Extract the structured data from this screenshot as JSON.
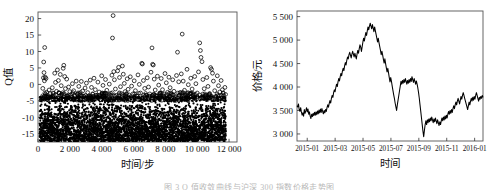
{
  "figure": {
    "caption": "图 3  Q 值收敛曲线与沪深 300 指数价格走势图",
    "background": "#ffffff",
    "ink": "#111111"
  },
  "chart_data": [
    {
      "type": "scatter",
      "id": "q-value-convergence",
      "title": "",
      "xlabel": "时间/步",
      "ylabel": "Q值",
      "xlim": [
        0,
        12500
      ],
      "ylim": [
        -17.5,
        22
      ],
      "xticks": [
        0,
        2000,
        4000,
        6000,
        8000,
        10000,
        12000
      ],
      "xtick_labels": [
        "0",
        "2 000",
        "4 000",
        "6 000",
        "8 000",
        "10 000",
        "12 000"
      ],
      "yticks": [
        20,
        15,
        10,
        5,
        0,
        -5,
        -10,
        -15
      ],
      "ytick_labels": [
        "20",
        "15",
        "10",
        "5",
        "0",
        "-5",
        "-10",
        "-15"
      ],
      "grid": false,
      "legend": null,
      "marker": "open-circle",
      "marker_color": "#000000",
      "description": "密集散点带集中于 -17 至 -5 区间，少量离群点分布至 +21",
      "dense_band": {
        "x_start": 100,
        "x_end": 11800,
        "y_low": -17.3,
        "y_high": -5.2,
        "n": 4200
      },
      "upper_points": [
        [
          300,
          -1.2
        ],
        [
          340,
          2.0
        ],
        [
          360,
          6.8
        ],
        [
          380,
          3.6
        ],
        [
          400,
          1.1
        ],
        [
          420,
          11.2
        ],
        [
          455,
          2.2
        ],
        [
          470,
          -3.0
        ],
        [
          500,
          1.8
        ],
        [
          540,
          -2.4
        ],
        [
          600,
          -4.0
        ],
        [
          640,
          -3.4
        ],
        [
          700,
          -1.7
        ],
        [
          760,
          -2.8
        ],
        [
          820,
          -3.9
        ],
        [
          900,
          -1.0
        ],
        [
          980,
          -3.3
        ],
        [
          1050,
          3.4
        ],
        [
          1100,
          0.6
        ],
        [
          1160,
          -2.1
        ],
        [
          1220,
          4.4
        ],
        [
          1280,
          1.2
        ],
        [
          1340,
          -2.6
        ],
        [
          1400,
          3.0
        ],
        [
          1460,
          -0.4
        ],
        [
          1520,
          -3.1
        ],
        [
          1580,
          4.9
        ],
        [
          1620,
          5.8
        ],
        [
          1680,
          2.4
        ],
        [
          1720,
          -1.3
        ],
        [
          1800,
          1.6
        ],
        [
          1860,
          -3.6
        ],
        [
          1920,
          -0.8
        ],
        [
          2000,
          -2.2
        ],
        [
          2080,
          -3.8
        ],
        [
          2160,
          0.2
        ],
        [
          2240,
          -1.9
        ],
        [
          2320,
          -3.5
        ],
        [
          2400,
          1.0
        ],
        [
          2480,
          -2.9
        ],
        [
          2560,
          -0.6
        ],
        [
          2640,
          -3.2
        ],
        [
          2720,
          0.9
        ],
        [
          2800,
          -2.0
        ],
        [
          2880,
          -3.7
        ],
        [
          2960,
          -1.1
        ],
        [
          3040,
          0.4
        ],
        [
          3120,
          -2.5
        ],
        [
          3200,
          -3.9
        ],
        [
          3280,
          1.3
        ],
        [
          3360,
          -0.9
        ],
        [
          3440,
          -3.0
        ],
        [
          3520,
          1.9
        ],
        [
          3600,
          -1.6
        ],
        [
          3680,
          -3.4
        ],
        [
          3760,
          0.7
        ],
        [
          3840,
          -2.3
        ],
        [
          3920,
          -3.6
        ],
        [
          4000,
          2.6
        ],
        [
          4080,
          -0.3
        ],
        [
          4160,
          -3.1
        ],
        [
          4240,
          1.5
        ],
        [
          4320,
          -1.8
        ],
        [
          4400,
          -3.8
        ],
        [
          4480,
          0.1
        ],
        [
          4560,
          -2.7
        ],
        [
          4640,
          2.8
        ],
        [
          4680,
          14.1
        ],
        [
          4720,
          20.9
        ],
        [
          4760,
          3.9
        ],
        [
          4800,
          1.4
        ],
        [
          4860,
          -1.4
        ],
        [
          4920,
          -3.3
        ],
        [
          5000,
          4.1
        ],
        [
          5060,
          5.2
        ],
        [
          5120,
          2.1
        ],
        [
          5180,
          -0.7
        ],
        [
          5240,
          -2.8
        ],
        [
          5300,
          5.6
        ],
        [
          5360,
          3.1
        ],
        [
          5420,
          0.3
        ],
        [
          5480,
          -2.2
        ],
        [
          5540,
          -3.7
        ],
        [
          5600,
          1.7
        ],
        [
          5660,
          -1.5
        ],
        [
          5720,
          -3.2
        ],
        [
          5800,
          2.3
        ],
        [
          5880,
          -0.5
        ],
        [
          5960,
          -2.9
        ],
        [
          6040,
          1.1
        ],
        [
          6120,
          -1.9
        ],
        [
          6200,
          -3.5
        ],
        [
          6280,
          2.9
        ],
        [
          6360,
          0.0
        ],
        [
          6440,
          -2.6
        ],
        [
          6520,
          6.4
        ],
        [
          6560,
          6.2
        ],
        [
          6620,
          1.2
        ],
        [
          6700,
          -1.2
        ],
        [
          6780,
          -3.3
        ],
        [
          6860,
          2.0
        ],
        [
          6940,
          -0.8
        ],
        [
          7020,
          -2.9
        ],
        [
          7100,
          3.7
        ],
        [
          7160,
          11.1
        ],
        [
          7200,
          6.1
        ],
        [
          7240,
          5.9
        ],
        [
          7300,
          1.6
        ],
        [
          7360,
          -1.7
        ],
        [
          7420,
          -3.4
        ],
        [
          7500,
          2.5
        ],
        [
          7580,
          -0.2
        ],
        [
          7660,
          -2.7
        ],
        [
          7740,
          1.8
        ],
        [
          7820,
          -1.6
        ],
        [
          7900,
          -3.6
        ],
        [
          7980,
          3.3
        ],
        [
          8060,
          0.5
        ],
        [
          8140,
          -2.4
        ],
        [
          8220,
          2.2
        ],
        [
          8300,
          -1.0
        ],
        [
          8380,
          -3.1
        ],
        [
          8460,
          1.4
        ],
        [
          8540,
          -2.1
        ],
        [
          8620,
          -3.8
        ],
        [
          8700,
          2.7
        ],
        [
          8760,
          9.8
        ],
        [
          8840,
          0.8
        ],
        [
          8920,
          -2.5
        ],
        [
          9000,
          3.2
        ],
        [
          9060,
          15.3
        ],
        [
          9120,
          1.0
        ],
        [
          9200,
          -1.8
        ],
        [
          9280,
          -3.5
        ],
        [
          9360,
          4.6
        ],
        [
          9440,
          -0.1
        ],
        [
          9520,
          -2.8
        ],
        [
          9600,
          1.9
        ],
        [
          9680,
          -1.4
        ],
        [
          9760,
          -3.2
        ],
        [
          9840,
          2.4
        ],
        [
          9920,
          0.2
        ],
        [
          10000,
          -2.6
        ],
        [
          10080,
          3.8
        ],
        [
          10160,
          12.6
        ],
        [
          10200,
          10.3
        ],
        [
          10240,
          8.2
        ],
        [
          10300,
          6.9
        ],
        [
          10360,
          1.5
        ],
        [
          10440,
          -1.3
        ],
        [
          10520,
          -3.4
        ],
        [
          10600,
          2.1
        ],
        [
          10680,
          -0.6
        ],
        [
          10760,
          -2.9
        ],
        [
          10840,
          5.1
        ],
        [
          10900,
          4.6
        ],
        [
          10960,
          3.4
        ],
        [
          11020,
          1.0
        ],
        [
          11100,
          -1.9
        ],
        [
          11180,
          -3.6
        ],
        [
          11260,
          2.6
        ],
        [
          11340,
          -0.4
        ],
        [
          11420,
          -2.3
        ],
        [
          11500,
          1.2
        ],
        [
          11580,
          -1.6
        ],
        [
          11660,
          -3.3
        ],
        [
          11740,
          -0.9
        ]
      ]
    },
    {
      "type": "line",
      "id": "price-series",
      "title": "",
      "xlabel": "时间",
      "ylabel": "价格/元",
      "xlim": [
        0,
        1
      ],
      "ylim": [
        2850,
        5620
      ],
      "xticks": [
        0.055,
        0.205,
        0.355,
        0.505,
        0.655,
        0.805,
        0.955
      ],
      "xtick_labels": [
        "2015-01",
        "2015-03",
        "2015-05",
        "2015-07",
        "2015-09",
        "2015-11",
        "2016-01"
      ],
      "yticks": [
        5500,
        5000,
        4500,
        4000,
        3500,
        3000
      ],
      "ytick_labels": [
        "5 500",
        "5 000",
        "4 500",
        "4 000",
        "3 500",
        "3 000"
      ],
      "grid": false,
      "legend": null,
      "line_color": "#000000",
      "values": [
        3600,
        3575,
        3640,
        3520,
        3480,
        3560,
        3470,
        3400,
        3450,
        3380,
        3520,
        3440,
        3490,
        3560,
        3470,
        3530,
        3420,
        3470,
        3380,
        3330,
        3420,
        3370,
        3440,
        3390,
        3460,
        3400,
        3470,
        3410,
        3490,
        3430,
        3510,
        3450,
        3530,
        3460,
        3540,
        3480,
        3430,
        3500,
        3450,
        3520,
        3480,
        3560,
        3620,
        3570,
        3650,
        3710,
        3660,
        3760,
        3820,
        3780,
        3880,
        3940,
        3900,
        3990,
        4060,
        4010,
        4110,
        4180,
        4130,
        4220,
        4290,
        4240,
        4340,
        4400,
        4350,
        4450,
        4520,
        4470,
        4570,
        4640,
        4600,
        4690,
        4740,
        4680,
        4620,
        4700,
        4760,
        4700,
        4640,
        4720,
        4660,
        4600,
        4700,
        4780,
        4720,
        4820,
        4900,
        4850,
        4760,
        4860,
        4960,
        5040,
        4980,
        5080,
        5160,
        5100,
        5200,
        5280,
        5220,
        5300,
        5360,
        5300,
        5240,
        5330,
        5260,
        5180,
        5280,
        5200,
        5120,
        5040,
        4960,
        5040,
        4940,
        4860,
        4780,
        4690,
        4760,
        4680,
        4590,
        4510,
        4600,
        4500,
        4410,
        4320,
        4400,
        4300,
        4200,
        4110,
        4200,
        4120,
        4020,
        3930,
        3840,
        3760,
        3660,
        3580,
        3500,
        3620,
        3720,
        3820,
        3920,
        4020,
        4120,
        4060,
        4140,
        4080,
        4160,
        4100,
        4180,
        4120,
        4060,
        4140,
        4080,
        4160,
        4100,
        4180,
        4120,
        4220,
        4160,
        4100,
        4180,
        4120,
        4060,
        4130,
        4060,
        3980,
        3880,
        3760,
        3620,
        3480,
        3340,
        3200,
        3060,
        2940,
        3080,
        3200,
        3280,
        3200,
        3300,
        3240,
        3320,
        3260,
        3340,
        3280,
        3360,
        3300,
        3240,
        3320,
        3260,
        3340,
        3280,
        3220,
        3300,
        3240,
        3180,
        3260,
        3200,
        3280,
        3340,
        3280,
        3360,
        3300,
        3380,
        3320,
        3400,
        3340,
        3420,
        3480,
        3420,
        3500,
        3440,
        3520,
        3460,
        3540,
        3600,
        3540,
        3620,
        3680,
        3620,
        3700,
        3760,
        3700,
        3640,
        3720,
        3800,
        3740,
        3820,
        3880,
        3820,
        3760,
        3700,
        3640,
        3580,
        3520,
        3600,
        3680,
        3620,
        3700,
        3760,
        3700,
        3780,
        3720,
        3800,
        3740,
        3820,
        3880,
        3820,
        3760,
        3700,
        3780,
        3740,
        3800,
        3760,
        3820,
        3780
      ]
    }
  ]
}
